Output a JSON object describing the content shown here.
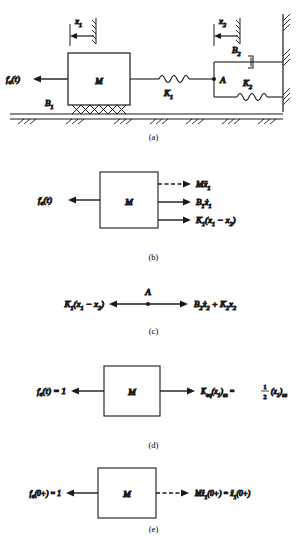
{
  "figure": {
    "type": "mechanical-system-free-body-diagrams",
    "panel_count": 5
  },
  "panels": {
    "a": {
      "caption": "(a)",
      "labels": {
        "x1": "x",
        "x1_sub": "1",
        "x2": "x",
        "x2_sub": "2",
        "force": "f",
        "force_sub": "a",
        "force_arg": "(t)",
        "mass": "M",
        "b1": "B",
        "b1_sub": "1",
        "k1": "K",
        "k1_sub": "1",
        "b2": "B",
        "b2_sub": "2",
        "k2": "K",
        "k2_sub": "2",
        "node": "A"
      },
      "elements": [
        "mass-M",
        "damper-B1",
        "spring-K1",
        "damper-B2",
        "spring-K2",
        "ground-hatching",
        "right-wall",
        "node-A"
      ]
    },
    "b": {
      "caption": "(b)",
      "mass": "M",
      "left_force": {
        "main": "f",
        "sub": "a",
        "arg": "(t)"
      },
      "right_forces": [
        {
          "id": "inertia",
          "dashed": true,
          "coef": "M",
          "var": "x",
          "var_sub": "1",
          "dots": 2,
          "tail": ""
        },
        {
          "id": "damping",
          "dashed": false,
          "coef": "B",
          "coef_sub": "1",
          "var": "x",
          "var_sub": "1",
          "dots": 1,
          "tail": ""
        },
        {
          "id": "spring",
          "dashed": false,
          "coef": "K",
          "coef_sub": "1",
          "var": "",
          "dots": 0,
          "tail": "(x1 − x2)"
        }
      ]
    },
    "c": {
      "caption": "(c)",
      "node": "A",
      "left_expr": {
        "coef": "K",
        "coef_sub": "1",
        "body": "(x",
        "b_sub1": "1",
        "mid": " − x",
        "b_sub2": "2",
        "close": ")"
      },
      "right_expr": {
        "t1_coef": "B",
        "t1_coef_sub": "2",
        "t1_var": "x",
        "t1_var_sub": "2",
        "plus": " + ",
        "t2_coef": "K",
        "t2_coef_sub": "2",
        "t2_var": "x",
        "t2_var_sub": "2"
      }
    },
    "d": {
      "caption": "(d)",
      "mass": "M",
      "left_force": {
        "main": "f",
        "sub": "a",
        "arg": "(t) = 1"
      },
      "right_force": {
        "coef": "K",
        "coef_sub": "eq",
        "var": "(x",
        "var_sub": "1",
        "close": ")",
        "ss": "ss",
        "eq": " = ",
        "frac_num": "1",
        "frac_den": "2",
        "var2": "(x",
        "var2_sub": "1",
        "close2": ")",
        "ss2": "ss"
      }
    },
    "e": {
      "caption": "(e)",
      "mass": "M",
      "left_force": {
        "main": "f",
        "sub": "a",
        "arg": "(0+) = 1"
      },
      "right_force": {
        "coef": "M",
        "var": "x",
        "var_sub": "1",
        "arg": "(0+)",
        "eq": " = ",
        "var2": "x",
        "var2_sub": "1",
        "arg2": "(0+)"
      },
      "dashed": true
    }
  },
  "colors": {
    "ink": "#1a1a1a",
    "background": "#ffffff"
  }
}
